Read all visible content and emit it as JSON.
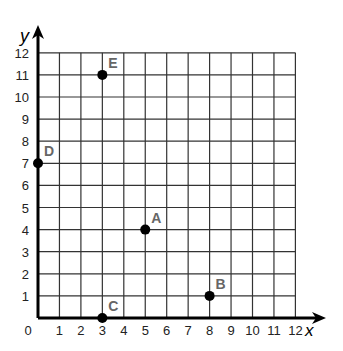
{
  "chart_data": {
    "type": "scatter",
    "title": "",
    "xlabel": "x",
    "ylabel": "y",
    "xlim": [
      0,
      12
    ],
    "ylim": [
      0,
      12
    ],
    "grid": true,
    "x_ticks": [
      "0",
      "1",
      "2",
      "3",
      "4",
      "5",
      "6",
      "7",
      "8",
      "9",
      "10",
      "11",
      "12"
    ],
    "y_ticks": [
      "1",
      "2",
      "3",
      "4",
      "5",
      "6",
      "7",
      "8",
      "9",
      "10",
      "11",
      "12"
    ],
    "points": [
      {
        "label": "A",
        "x": 5,
        "y": 4
      },
      {
        "label": "B",
        "x": 8,
        "y": 1
      },
      {
        "label": "C",
        "x": 3,
        "y": 0
      },
      {
        "label": "D",
        "x": 0,
        "y": 7
      },
      {
        "label": "E",
        "x": 3,
        "y": 11
      }
    ]
  },
  "colors": {
    "grid": "#333333",
    "axis": "#000000",
    "point": "#000000",
    "label": "#666666"
  }
}
